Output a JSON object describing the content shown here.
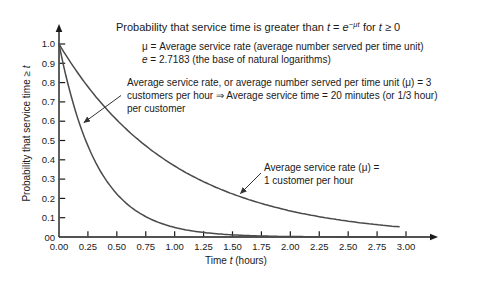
{
  "title": {
    "prefix": "Probability that service time is greater than ",
    "t1": "t",
    "eq": " = ",
    "e_var": "e",
    "exponent": "−μt",
    "mid": " for ",
    "t2": "t",
    "suffix": " ≥ 0"
  },
  "notes": {
    "mu_line": "μ = Average service rate (average number served per time unit)",
    "e_var": "e",
    "e_rest": " = 2.7183 (the base of natural logarithms)"
  },
  "annotation_mu3": {
    "line1": "Average service rate, or average number served per time unit (μ) = 3",
    "line2": "customers per hour ⇒ Average service time = 20 minutes (or 1/3 hour)",
    "line3": "per customer"
  },
  "annotation_mu1": {
    "line1": "Average service rate (μ) =",
    "line2": "1 customer per hour"
  },
  "y_axis": {
    "label_prefix": "Probability that service time ≥ ",
    "label_var": "t"
  },
  "x_axis": {
    "label_prefix": "Time ",
    "label_var": "t",
    "label_suffix": " (hours)"
  },
  "chart_data": {
    "type": "line",
    "xlabel": "Time t (hours)",
    "ylabel": "Probability that service time ≥ t",
    "xlim": [
      0,
      3
    ],
    "ylim": [
      0,
      1
    ],
    "grid": false,
    "legend_position": "annotated-arrows",
    "x_ticks": [
      "0.00",
      "0.25",
      "0.50",
      "0.75",
      "1.00",
      "1.25",
      "1.50",
      "1.75",
      "2.00",
      "2.25",
      "2.50",
      "2.75",
      "3.00"
    ],
    "y_ticks": [
      "1.0",
      "0.9",
      "0.8",
      "0.7",
      "0.6",
      "0.5",
      "0.4",
      "0.3",
      "0.2",
      "0.1",
      "00"
    ],
    "series": [
      {
        "name": "Average service rate (μ) = 3 customers per hour",
        "formula": "P(T > t) = e^(−3t)",
        "mu": 3,
        "x": [
          0,
          0.25,
          0.5,
          0.75,
          1.0,
          1.25,
          1.5,
          1.75,
          2.0,
          2.25,
          2.5,
          2.75,
          3.0
        ],
        "values": [
          1.0,
          0.472,
          0.223,
          0.105,
          0.05,
          0.024,
          0.011,
          0.005,
          0.002,
          0.001,
          0.001,
          0.0,
          0.0
        ]
      },
      {
        "name": "Average service rate (μ) = 1 customer per hour",
        "formula": "P(T > t) = e^(−t)",
        "mu": 1,
        "x": [
          0,
          0.25,
          0.5,
          0.75,
          1.0,
          1.25,
          1.5,
          1.75,
          2.0,
          2.25,
          2.5,
          2.75,
          3.0
        ],
        "values": [
          1.0,
          0.779,
          0.607,
          0.472,
          0.368,
          0.287,
          0.223,
          0.174,
          0.135,
          0.105,
          0.082,
          0.064,
          0.05
        ]
      }
    ],
    "colors": {
      "curve": "#4a4a4a",
      "axis": "#1a1a1a",
      "text": "#1a1a1a",
      "annotation_arrow": "#333333"
    }
  }
}
